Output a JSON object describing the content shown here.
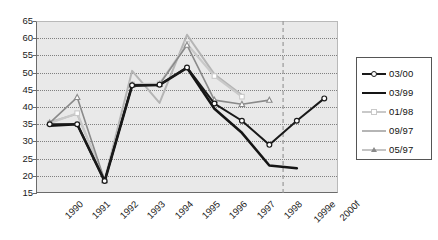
{
  "chart_data": {
    "type": "line",
    "title": "",
    "xlabel": "",
    "ylabel": "",
    "ylim": [
      15,
      65
    ],
    "yticks": [
      15,
      20,
      25,
      30,
      35,
      40,
      45,
      50,
      55,
      60,
      65
    ],
    "grid": true,
    "legend_position": "right",
    "categories": [
      "1990",
      "1991",
      "1992",
      "1993",
      "1994",
      "1995",
      "1996",
      "1997",
      "1998",
      "1999e",
      "2000f"
    ],
    "forecast_divider_after": "1998",
    "series": [
      {
        "name": "03/00",
        "color": "#1a1a1a",
        "marker": "circle",
        "width": 2.0,
        "values": [
          35.0,
          35.0,
          18.5,
          46.3,
          46.5,
          51.5,
          41.0,
          36.0,
          29.0,
          36.0,
          42.5
        ]
      },
      {
        "name": "03/99",
        "color": "#151515",
        "marker": "none",
        "width": 2.6,
        "values": [
          34.6,
          35.0,
          18.4,
          46.2,
          46.4,
          51.4,
          39.5,
          32.5,
          23.0,
          22.2,
          null
        ]
      },
      {
        "name": "01/98",
        "color": "#c9c9c9",
        "marker": "diamond",
        "width": 2.2,
        "values": [
          35.3,
          38.2,
          18.7,
          46.6,
          46.8,
          58.3,
          49.0,
          43.0,
          null,
          null,
          null
        ]
      },
      {
        "name": "09/97",
        "color": "#b5b5b5",
        "marker": "none",
        "width": 2.0,
        "values": [
          35.6,
          38.0,
          18.8,
          50.5,
          41.2,
          61.0,
          49.5,
          43.5,
          null,
          null,
          null
        ]
      },
      {
        "name": "05/97",
        "color": "#8a8a8a",
        "marker": "triangle",
        "width": 1.6,
        "values": [
          35.4,
          42.8,
          18.6,
          46.4,
          46.6,
          58.0,
          42.0,
          40.8,
          42.0,
          null,
          null
        ]
      }
    ]
  },
  "legend": {
    "entries": [
      {
        "label": "03/00"
      },
      {
        "label": "03/99"
      },
      {
        "label": "01/98"
      },
      {
        "label": "09/97"
      },
      {
        "label": "05/97"
      }
    ]
  }
}
